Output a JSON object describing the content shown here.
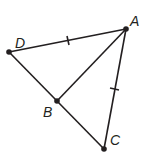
{
  "diagram": {
    "type": "geometry",
    "points": {
      "A": {
        "label": "A",
        "x": 126,
        "y": 29
      },
      "B": {
        "label": "B",
        "x": 57,
        "y": 101
      },
      "C": {
        "label": "C",
        "x": 104,
        "y": 149
      },
      "D": {
        "label": "D",
        "x": 9,
        "y": 52
      }
    },
    "segments": [
      {
        "from": "D",
        "to": "A",
        "tick_marks": 1
      },
      {
        "from": "A",
        "to": "C",
        "tick_marks": 1
      },
      {
        "from": "D",
        "to": "C",
        "tick_marks": 0
      },
      {
        "from": "A",
        "to": "B",
        "tick_marks": 0
      }
    ],
    "stroke_color": "#231f20"
  }
}
